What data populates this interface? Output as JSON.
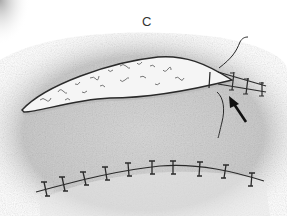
{
  "figure": {
    "panel_label": "C",
    "elements": [
      {
        "name": "packed-wound",
        "description": "elongated open wound packed with gauze, tapering to the right"
      },
      {
        "name": "closure-sutures",
        "description": "interrupted sutures closing the tapered right end of the wound",
        "count": 3
      },
      {
        "name": "loose-suture-ends",
        "description": "two untied suture strands above and below the wound apex"
      },
      {
        "name": "arrow",
        "description": "black arrow pointing up-left at the wound apex / first suture"
      },
      {
        "name": "sutured-incision",
        "description": "curved incision closed with interrupted sutures",
        "count": 11
      }
    ],
    "colors": {
      "background": "#ffffff",
      "skin_shading": "#bdbdbd",
      "outline": "#2a2a2a",
      "gauze": "#f4f4f4"
    }
  }
}
